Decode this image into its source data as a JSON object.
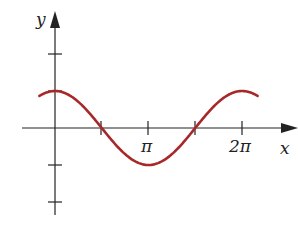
{
  "chart_data": {
    "type": "line",
    "title": "",
    "function": "y = cos(x)",
    "xlabel": "x",
    "ylabel": "y",
    "x_ticks": [
      {
        "value": 3.14159,
        "label": "π"
      },
      {
        "value": 6.28318,
        "label": "2π"
      }
    ],
    "y_ticks": [
      {
        "value": 2,
        "label": ""
      },
      {
        "value": 1,
        "label": ""
      },
      {
        "value": -1,
        "label": ""
      },
      {
        "value": -2,
        "label": ""
      }
    ],
    "xlim": [
      -0.52,
      6.81
    ],
    "ylim": [
      -2.2,
      3.1
    ],
    "grid": false,
    "legend": null,
    "series": [
      {
        "name": "cos(x)",
        "color": "#a8282a",
        "x": [
          -0.5236,
          0,
          0.7854,
          1.5708,
          2.3562,
          3.1416,
          3.927,
          4.7124,
          5.4978,
          6.2832,
          6.8068
        ],
        "values": [
          0.866,
          1,
          0.707,
          0,
          -0.707,
          -1,
          -0.707,
          0,
          0.707,
          1,
          0.866
        ]
      }
    ]
  },
  "axes": {
    "x_label": "x",
    "y_label": "y",
    "pi_label": "π",
    "two_pi_label": "2π",
    "axis_color": "#222222",
    "curve_color": "#a8282a"
  },
  "layout": {
    "origin_px": [
      55,
      128
    ],
    "px_per_unit_x": 30,
    "px_per_unit_y": 37
  }
}
